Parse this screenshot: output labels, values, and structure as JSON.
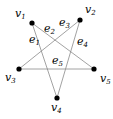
{
  "diagram": {
    "type": "graph",
    "vertices": [
      {
        "id": "v1",
        "base": "v",
        "sub": "1",
        "x": 32,
        "y": 23,
        "lx": 15,
        "ly": 17
      },
      {
        "id": "v2",
        "base": "v",
        "sub": "2",
        "x": 80,
        "y": 20,
        "lx": 85,
        "ly": 13
      },
      {
        "id": "v3",
        "base": "v",
        "sub": "3",
        "x": 19,
        "y": 69,
        "lx": 5,
        "ly": 81
      },
      {
        "id": "v4",
        "base": "v",
        "sub": "4",
        "x": 57,
        "y": 98,
        "lx": 51,
        "ly": 111
      },
      {
        "id": "v5",
        "base": "v",
        "sub": "5",
        "x": 94,
        "y": 69,
        "lx": 100,
        "ly": 82
      }
    ],
    "edges": [
      {
        "id": "e1",
        "base": "e",
        "sub": "1",
        "from": "v1",
        "to": "v4",
        "lx": 29,
        "ly": 43
      },
      {
        "id": "e2",
        "base": "e",
        "sub": "2",
        "from": "v1",
        "to": "v5",
        "lx": 44,
        "ly": 32
      },
      {
        "id": "e3",
        "base": "e",
        "sub": "3",
        "from": "v2",
        "to": "v3",
        "lx": 59,
        "ly": 26
      },
      {
        "id": "e4",
        "base": "e",
        "sub": "4",
        "from": "v2",
        "to": "v4",
        "lx": 77,
        "ly": 45
      },
      {
        "id": "e5",
        "base": "e",
        "sub": "5",
        "from": "v3",
        "to": "v5",
        "lx": 52,
        "ly": 64
      }
    ]
  }
}
